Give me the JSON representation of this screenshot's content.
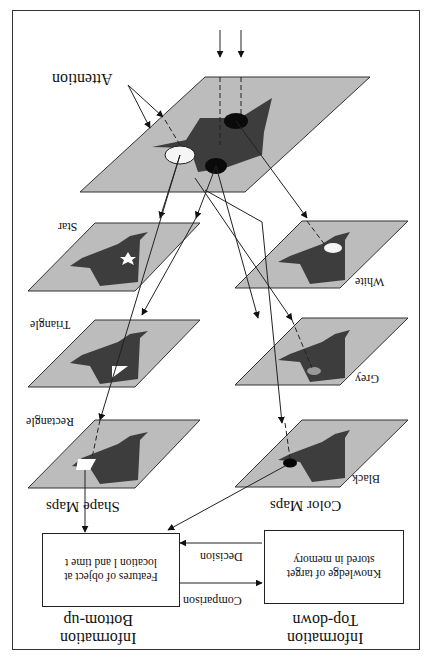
{
  "orientation": "rotated 180 degrees",
  "top_plane": {
    "stimuli_label": "Stimuli",
    "attention_label": "Attention"
  },
  "shape_maps": {
    "group_label": "Shape Maps",
    "maps": [
      {
        "label": "Star"
      },
      {
        "label": "Triangle"
      },
      {
        "label": "Rectangle"
      }
    ]
  },
  "color_maps": {
    "group_label": "Color Maps",
    "maps": [
      {
        "label": "White"
      },
      {
        "label": "Grey"
      },
      {
        "label": "Black"
      }
    ]
  },
  "bottom_up": {
    "heading_line1": "Bottom-up",
    "heading_line2": "Information",
    "box_text": "Features of object at location l and time t"
  },
  "top_down": {
    "heading_line1": "Top-down",
    "heading_line2": "Information",
    "box_text": "Knowledge of target stored in memory"
  },
  "arrows": {
    "comparison_label": "Comparison",
    "decision_label": "Decision"
  },
  "colors": {
    "plane": "#bcbcbc",
    "map_shape": "#3c3c3c",
    "line": "#222222"
  }
}
